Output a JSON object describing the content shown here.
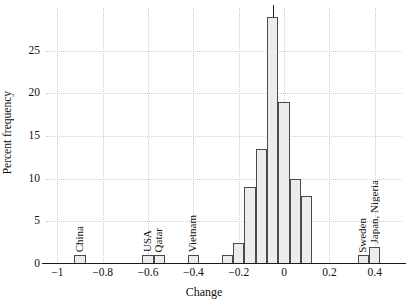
{
  "chart_data": {
    "type": "bar",
    "title": "",
    "subtitle": "",
    "xlabel": "Change",
    "ylabel": "Percent frequency",
    "xlim": [
      -1.05,
      0.52
    ],
    "ylim": [
      0,
      30
    ],
    "grid": true,
    "legend": null,
    "bin_width": 0.05,
    "x_ticks": [
      {
        "value": -1,
        "label": "−1"
      },
      {
        "value": -0.8,
        "label": "−0.8"
      },
      {
        "value": -0.6,
        "label": "−0.6"
      },
      {
        "value": -0.4,
        "label": "−0.4"
      },
      {
        "value": -0.2,
        "label": "−0.2"
      },
      {
        "value": 0,
        "label": "0"
      },
      {
        "value": 0.2,
        "label": "0.2"
      },
      {
        "value": 0.4,
        "label": "0.4"
      }
    ],
    "y_ticks": [
      {
        "value": 0,
        "label": "0"
      },
      {
        "value": 5,
        "label": "5"
      },
      {
        "value": 10,
        "label": "10"
      },
      {
        "value": 15,
        "label": "15"
      },
      {
        "value": 20,
        "label": "20"
      },
      {
        "value": 25,
        "label": "25"
      }
    ],
    "bars": [
      {
        "x0": -0.925,
        "x1": -0.875,
        "value": 1.0
      },
      {
        "x0": -0.625,
        "x1": -0.575,
        "value": 1.0
      },
      {
        "x0": -0.575,
        "x1": -0.525,
        "value": 1.0
      },
      {
        "x0": -0.425,
        "x1": -0.375,
        "value": 1.0
      },
      {
        "x0": -0.275,
        "x1": -0.225,
        "value": 1.0
      },
      {
        "x0": -0.225,
        "x1": -0.175,
        "value": 2.5
      },
      {
        "x0": -0.175,
        "x1": -0.125,
        "value": 9.0
      },
      {
        "x0": -0.125,
        "x1": -0.075,
        "value": 13.5
      },
      {
        "x0": -0.075,
        "x1": -0.025,
        "value": 29.0
      },
      {
        "x0": -0.025,
        "x1": 0.025,
        "value": 19.0
      },
      {
        "x0": 0.025,
        "x1": 0.075,
        "value": 10.0
      },
      {
        "x0": 0.075,
        "x1": 0.125,
        "value": 8.0
      },
      {
        "x0": 0.325,
        "x1": 0.375,
        "value": 1.0
      },
      {
        "x0": 0.375,
        "x1": 0.425,
        "value": 2.0
      }
    ],
    "annotations": [
      {
        "label": "China",
        "x": -0.9,
        "value": 1.0
      },
      {
        "label": "USA",
        "x": -0.6,
        "value": 1.0
      },
      {
        "label": "Qatar",
        "x": -0.55,
        "value": 1.0
      },
      {
        "label": "Vietnam",
        "x": -0.4,
        "value": 1.0
      },
      {
        "label": "Sweden",
        "x": 0.35,
        "value": 1.0
      },
      {
        "label": "Japan, Nigeria",
        "x": 0.4,
        "value": 2.0
      }
    ],
    "colors": {
      "bar_fill": "#ececec",
      "bar_edge": "#4a4a4a",
      "axis": "#1a1a1a",
      "grid": "#cfcfcf",
      "text": "#111111",
      "background": "#ffffff"
    }
  }
}
